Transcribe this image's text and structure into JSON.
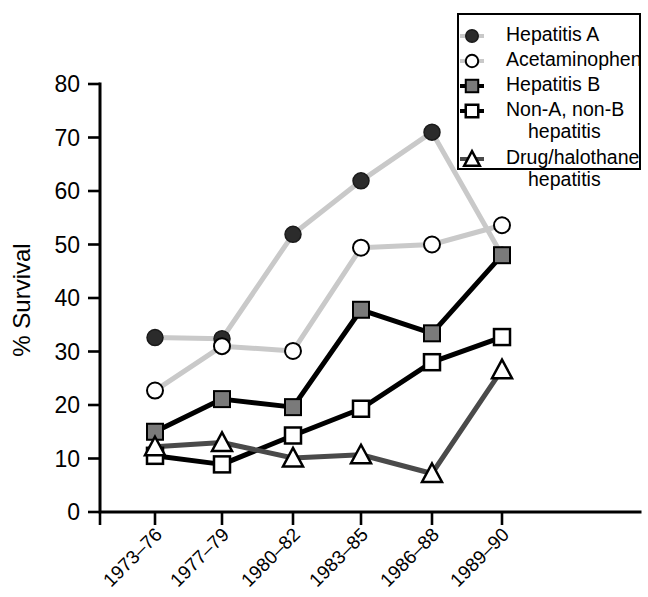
{
  "chart_data": {
    "type": "line",
    "title": "",
    "subtitle": "",
    "xlabel": "",
    "ylabel": "% Survival",
    "categories": [
      "1973–76",
      "1977–79",
      "1980–82",
      "1983–85",
      "1986–88",
      "1989–90"
    ],
    "ylim": [
      0,
      80
    ],
    "yticks": [
      0,
      10,
      20,
      30,
      40,
      50,
      60,
      70,
      80
    ],
    "ytick_labels": [
      "0",
      "10",
      "20",
      "30",
      "40",
      "50",
      "60",
      "70",
      "80"
    ],
    "grid": false,
    "legend_position": "top-right",
    "series": [
      {
        "name": "Hepatitis A",
        "values": [
          32.6,
          32.4,
          51.9,
          61.9,
          71.0,
          48.0
        ],
        "marker": "filled-circle",
        "marker_fill": "#2b2b2b",
        "line_color": "#c9c9c9"
      },
      {
        "name": "Acetaminophen",
        "values": [
          22.7,
          31.0,
          30.1,
          49.4,
          50.0,
          53.6
        ],
        "marker": "open-circle",
        "marker_fill": "#ffffff",
        "line_color": "#c9c9c9"
      },
      {
        "name": "Hepatitis B",
        "values": [
          15.0,
          21.1,
          19.6,
          37.8,
          33.4,
          48.0
        ],
        "marker": "filled-square",
        "marker_fill": "#7a7a7a",
        "line_color": "#000000"
      },
      {
        "name": "Non-A, non-B hepatitis",
        "values": [
          10.5,
          8.9,
          14.3,
          19.3,
          28.0,
          32.7
        ],
        "marker": "open-square",
        "marker_fill": "#ffffff",
        "line_color": "#000000"
      },
      {
        "name": "Drug/halothane hepatitis",
        "values": [
          12.2,
          13.0,
          10.1,
          10.7,
          7.2,
          26.6
        ],
        "marker": "open-triangle",
        "marker_fill": "#ffffff",
        "line_color": "#4a4a4a"
      }
    ]
  },
  "legend": {
    "entries": [
      {
        "line1": "Hepatitis A",
        "line2": ""
      },
      {
        "line1": "Acetaminophen",
        "line2": ""
      },
      {
        "line1": "Hepatitis B",
        "line2": ""
      },
      {
        "line1": "Non-A, non-B",
        "line2": "hepatitis"
      },
      {
        "line1": "Drug/halothane",
        "line2": "hepatitis"
      }
    ]
  },
  "colors": {
    "axis": "#000000",
    "light_line": "#c9c9c9",
    "black_line": "#000000",
    "gray_line": "#4a4a4a",
    "square_fill": "#7a7a7a",
    "circle_fill": "#2b2b2b",
    "open_fill": "#ffffff"
  }
}
